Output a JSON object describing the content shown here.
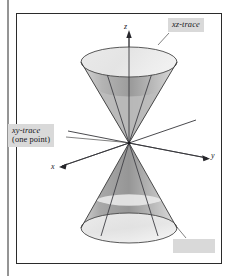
{
  "figure": {
    "kind": "3d-surface-plot",
    "background_color": "#ffffff",
    "frame": {
      "border_color": "#2b2b2b",
      "left_rule_x": 8,
      "rect": {
        "x": 16,
        "y": 13,
        "width": 206,
        "height": 251
      }
    },
    "axes": [
      {
        "name": "z-axis",
        "label": "z",
        "direction": "up",
        "label_x": 127,
        "label_y": 25
      },
      {
        "name": "y-axis",
        "label": "y",
        "direction": "lower-right",
        "label_x": 213,
        "label_y": 154
      },
      {
        "name": "x-axis",
        "label": "x",
        "direction": "lower-left",
        "label_x": 54,
        "label_y": 164
      }
    ],
    "origin": {
      "x": 129,
      "y": 143
    },
    "surface": {
      "type": "double-cone",
      "upper_top_ellipse": {
        "cx": 129,
        "cy": 62,
        "rx": 48,
        "ry": 15
      },
      "lower_base_ellipse": {
        "cx": 129,
        "cy": 228,
        "rx": 48,
        "ry": 15
      },
      "fill_light": "#e4e4e4",
      "fill_mid": "#c9c9c9",
      "fill_dark": "#8f8f8f",
      "outline_color": "#3a3a3a"
    },
    "traces": [
      {
        "name": "xz-trace",
        "description": "pair of lines on the cone in the xz-plane"
      },
      {
        "name": "xy-trace",
        "description": "single point at the origin"
      }
    ]
  },
  "labels": {
    "xz_trace": "xz-trace",
    "xy_trace_line1": "xy-trace",
    "xy_trace_line2": "(one point)",
    "blank_caption": ""
  },
  "colors": {
    "label_background": "#d9d9d9",
    "label_text": "#17171b",
    "ink": "#2b2b2b",
    "page": "#ffffff"
  }
}
